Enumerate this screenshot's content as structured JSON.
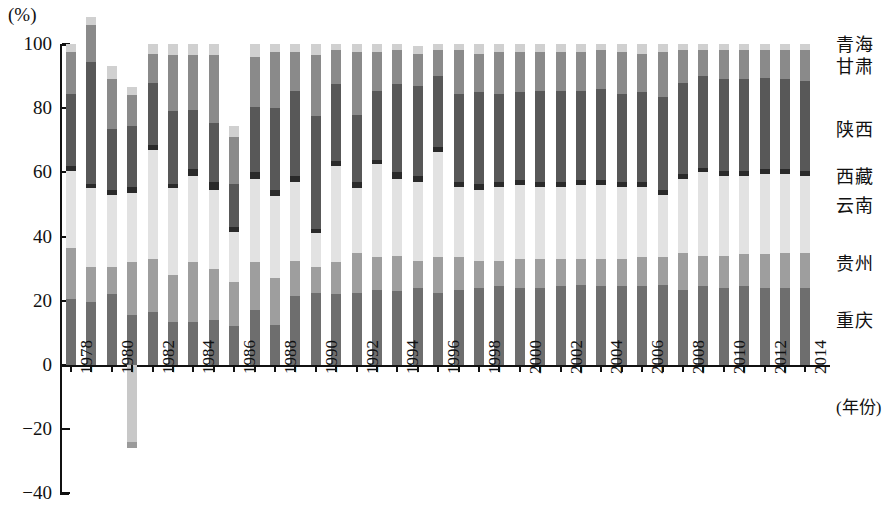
{
  "chart_data": {
    "type": "bar",
    "stacked": true,
    "title": "",
    "subtitle": "",
    "xlabel": "(年份)",
    "ylabel": "(%)",
    "ylim": [
      -40,
      100
    ],
    "yticks": [
      -40,
      -20,
      0,
      20,
      40,
      60,
      80,
      100
    ],
    "ytick_labels": [
      "-40",
      "-20",
      "0",
      "20",
      "40",
      "60",
      "80",
      "100"
    ],
    "grid": false,
    "legend_position": "right-inline",
    "x": [
      1978,
      1979,
      1980,
      1981,
      1982,
      1983,
      1984,
      1985,
      1986,
      1987,
      1988,
      1989,
      1990,
      1991,
      1992,
      1993,
      1994,
      1995,
      1996,
      1997,
      1998,
      1999,
      2000,
      2001,
      2002,
      2003,
      2004,
      2005,
      2006,
      2007,
      2008,
      2009,
      2010,
      2011,
      2012,
      2013,
      2014
    ],
    "xtick_labels": [
      "1978",
      "",
      "1980",
      "",
      "1982",
      "",
      "1984",
      "",
      "1986",
      "",
      "1988",
      "",
      "1990",
      "",
      "1992",
      "",
      "1994",
      "",
      "1996",
      "",
      "1998",
      "",
      "2000",
      "",
      "2002",
      "",
      "2004",
      "",
      "2006",
      "",
      "2008",
      "",
      "2010",
      "",
      "2012",
      "",
      "2014"
    ],
    "series": [
      {
        "name": "重庆",
        "color": "#6e6e6e",
        "values": [
          20.5,
          19.5,
          22.0,
          15.5,
          16.5,
          13.5,
          13.5,
          14.0,
          12.0,
          17.0,
          12.5,
          21.5,
          22.5,
          22.0,
          22.5,
          23.5,
          23.0,
          24.0,
          22.5,
          23.5,
          24.0,
          24.5,
          24.0,
          24.0,
          24.5,
          25.0,
          24.5,
          24.5,
          24.5,
          25.0,
          23.5,
          24.5,
          24.0,
          24.5,
          24.0,
          24.0,
          24.0
        ]
      },
      {
        "name": "贵州",
        "color": "#9e9e9e",
        "values": [
          16.0,
          11.0,
          8.5,
          16.5,
          16.5,
          14.5,
          18.5,
          16.0,
          14.0,
          15.0,
          14.5,
          11.0,
          8.0,
          10.0,
          12.5,
          10.0,
          11.0,
          8.5,
          11.0,
          10.0,
          8.5,
          8.0,
          9.0,
          9.0,
          8.5,
          8.0,
          8.5,
          8.5,
          9.0,
          8.5,
          11.5,
          9.5,
          10.0,
          10.0,
          10.5,
          11.0,
          11.0
        ]
      },
      {
        "name": "云南",
        "color": "#e2e2e2",
        "values": [
          24.0,
          24.5,
          22.5,
          21.5,
          34.0,
          27.0,
          27.0,
          24.5,
          15.5,
          26.0,
          25.5,
          24.5,
          10.5,
          30.0,
          20.0,
          29.0,
          24.0,
          24.5,
          33.0,
          22.0,
          22.0,
          23.0,
          23.0,
          22.5,
          22.5,
          23.0,
          23.0,
          22.5,
          22.0,
          19.5,
          23.0,
          26.0,
          25.0,
          24.5,
          25.0,
          24.5,
          24.0
        ]
      },
      {
        "name": "西藏",
        "color": "#2a2a2a",
        "values": [
          1.5,
          1.5,
          1.5,
          2.0,
          1.5,
          1.5,
          2.0,
          2.5,
          1.5,
          2.0,
          2.0,
          2.0,
          1.5,
          1.5,
          2.0,
          1.5,
          2.0,
          2.0,
          1.5,
          1.5,
          2.0,
          1.5,
          1.5,
          1.5,
          1.5,
          1.5,
          1.5,
          1.5,
          1.5,
          1.5,
          1.5,
          1.5,
          1.5,
          1.5,
          1.5,
          1.5,
          1.5
        ]
      },
      {
        "name": "陕西",
        "color": "#585858",
        "values": [
          22.5,
          38.0,
          19.0,
          19.0,
          19.5,
          22.5,
          18.5,
          18.5,
          13.5,
          20.5,
          25.5,
          26.5,
          35.0,
          24.0,
          21.0,
          21.5,
          27.5,
          28.0,
          22.0,
          27.5,
          28.5,
          27.5,
          27.5,
          28.5,
          28.5,
          28.0,
          28.5,
          27.5,
          28.0,
          29.0,
          28.5,
          28.5,
          28.5,
          28.5,
          28.5,
          28.0,
          28.0
        ]
      },
      {
        "name": "甘肃",
        "color": "#8a8a8a",
        "values": [
          13.0,
          11.5,
          15.5,
          9.5,
          9.0,
          17.5,
          17.0,
          21.0,
          14.5,
          15.5,
          17.5,
          12.0,
          19.0,
          10.5,
          19.5,
          12.0,
          10.5,
          10.0,
          8.0,
          13.5,
          12.0,
          13.0,
          12.5,
          12.0,
          12.0,
          12.0,
          12.0,
          13.0,
          12.0,
          14.0,
          10.0,
          8.0,
          9.0,
          9.0,
          8.5,
          9.0,
          9.5
        ]
      },
      {
        "name": "青海",
        "color": "#d0d0d0",
        "values": [
          2.5,
          2.5,
          4.0,
          2.5,
          3.0,
          3.5,
          3.5,
          3.5,
          3.5,
          4.0,
          2.5,
          2.5,
          3.5,
          2.0,
          2.5,
          2.5,
          2.0,
          2.5,
          2.0,
          2.0,
          3.0,
          2.5,
          2.5,
          2.5,
          2.5,
          2.5,
          2.0,
          2.5,
          3.0,
          2.5,
          2.0,
          2.0,
          2.0,
          2.0,
          2.0,
          2.0,
          2.0
        ]
      }
    ],
    "special_notes": {
      "1981_negative": {
        "series": "云南",
        "value": -26.0,
        "color": "#c8c8c8",
        "comment": "1981 bar extends below zero to about -26%"
      },
      "1986_top": 83.0,
      "1980_top": 93.0,
      "1981_top": 74.0
    }
  },
  "axis": {
    "unit_label": "(%)",
    "x_title": "(年份)",
    "ytick_labels": [
      "100",
      "80",
      "60",
      "40",
      "20",
      "0",
      "-20",
      "-40"
    ]
  },
  "legend": {
    "items": [
      {
        "label": "青海",
        "top": 36
      },
      {
        "label": "甘肃",
        "top": 58
      },
      {
        "label": "陕西",
        "top": 121
      },
      {
        "label": "西藏",
        "top": 168
      },
      {
        "label": "云南",
        "top": 197
      },
      {
        "label": "贵州",
        "top": 255
      },
      {
        "label": "重庆",
        "top": 312
      }
    ]
  }
}
